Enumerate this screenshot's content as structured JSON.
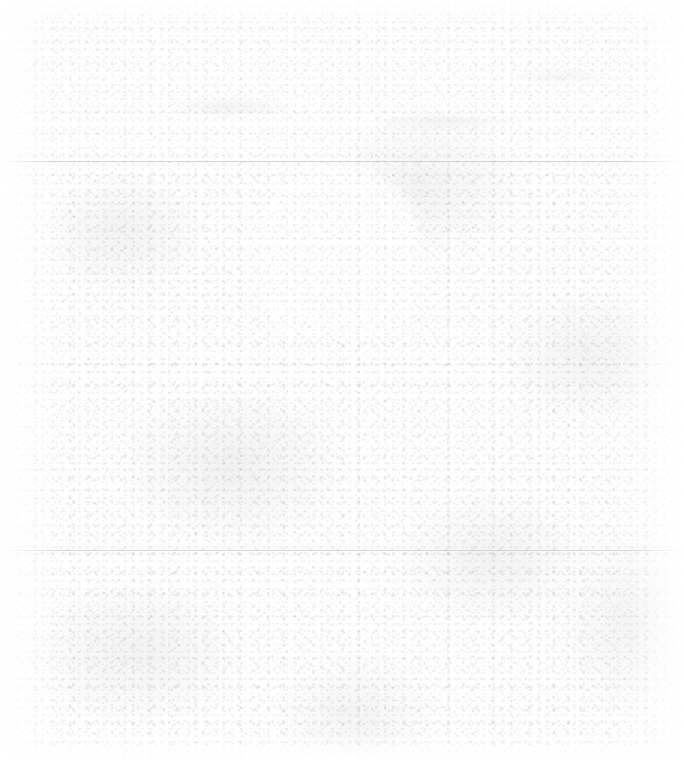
{
  "image": {
    "width": 684,
    "height": 776,
    "condition": "severely-faded",
    "legible_text": "none",
    "background_color": "#fefefe",
    "noise_color": "#7d838b"
  },
  "regions": {
    "header_band": {
      "name": "header-band",
      "x": 55,
      "y": 20,
      "width": 575,
      "height": 141,
      "note": "faint indistinct text traces, unreadable"
    },
    "divider_top": {
      "name": "divider-top",
      "y": 161,
      "color": "#969ca4"
    },
    "content_block": {
      "name": "content-block",
      "x": 55,
      "y": 161,
      "width": 575,
      "height": 574,
      "note": "uniform grain texture, no legible content"
    },
    "bright_panel": {
      "name": "bright-panel",
      "x": 255,
      "y": 165,
      "width": 165,
      "height": 165,
      "corner_radius": 80,
      "color": "#ffffff",
      "note": "brighter rounded region, upper centre"
    },
    "divider_bottom": {
      "name": "divider-bottom",
      "y": 550,
      "color": "#969ca4"
    },
    "bottom_edge": {
      "name": "bottom-edge",
      "y": 735
    }
  }
}
